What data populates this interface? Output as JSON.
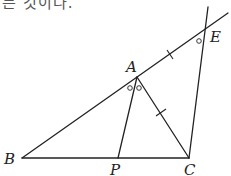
{
  "header_text": "는 것이다.",
  "diagram": {
    "points": {
      "A": {
        "label": "A",
        "x": 137,
        "y": 77
      },
      "B": {
        "label": "B",
        "x": 22,
        "y": 158
      },
      "C": {
        "label": "C",
        "x": 189,
        "y": 158
      },
      "P": {
        "label": "P",
        "x": 118,
        "y": 158
      },
      "E": {
        "label": "E",
        "x": 205,
        "y": 27
      }
    },
    "segments": [
      "BC",
      "BA-extended-through-E",
      "AP",
      "AC",
      "CE-extended"
    ],
    "equal_marks": [
      "AE",
      "AC"
    ],
    "angle_marks": [
      "angle BAP",
      "angle PAC",
      "angle AEC"
    ]
  }
}
